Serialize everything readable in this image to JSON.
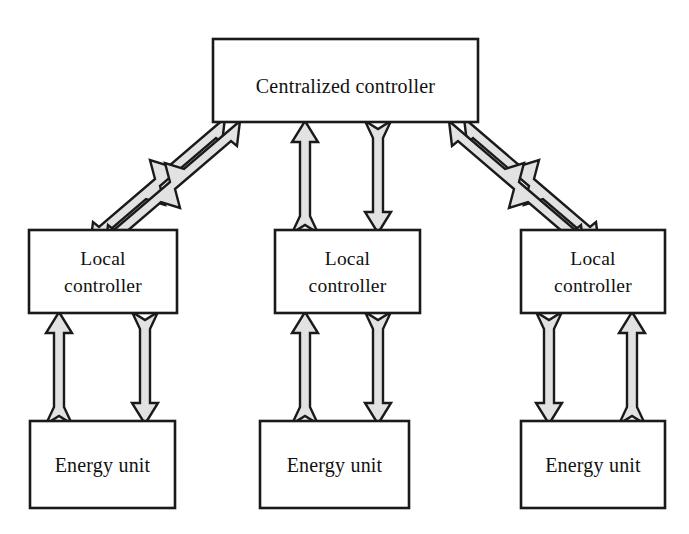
{
  "diagram": {
    "colors": {
      "box_fill": "#ffffff",
      "box_stroke": "#1a1a1a",
      "arrow_fill": "#e2e2e2",
      "arrow_stroke": "#1a1a1a",
      "background": "#ffffff",
      "text": "#111111"
    },
    "nodes": {
      "centralized_controller": {
        "label": "Centralized controller",
        "x": 213,
        "y": 39,
        "w": 265,
        "h": 83
      },
      "local_controllers": [
        {
          "label_line1": "Local",
          "label_line2": "controller",
          "x": 29,
          "y": 230,
          "w": 148,
          "h": 83
        },
        {
          "label_line1": "Local",
          "label_line2": "controller",
          "x": 275,
          "y": 230,
          "w": 145,
          "h": 83
        },
        {
          "label_line1": "Local",
          "label_line2": "controller",
          "x": 521,
          "y": 230,
          "w": 144,
          "h": 83
        }
      ],
      "energy_units": [
        {
          "label": "Energy unit",
          "x": 30,
          "y": 421,
          "w": 145,
          "h": 87
        },
        {
          "label": "Energy unit",
          "x": 260,
          "y": 421,
          "w": 149,
          "h": 87
        },
        {
          "label": "Energy unit",
          "x": 521,
          "y": 421,
          "w": 144,
          "h": 87
        }
      ]
    },
    "connections": [
      {
        "name": "left-local-to-centralized",
        "direction": "up-right",
        "style": "block-arrow"
      },
      {
        "name": "centralized-to-left-local",
        "direction": "down-left",
        "style": "block-arrow"
      },
      {
        "name": "middle-local-to-centralized",
        "direction": "up",
        "style": "block-arrow"
      },
      {
        "name": "centralized-to-middle-local",
        "direction": "down",
        "style": "block-arrow"
      },
      {
        "name": "right-local-to-centralized",
        "direction": "up-left",
        "style": "block-arrow"
      },
      {
        "name": "centralized-to-right-local",
        "direction": "down-right",
        "style": "block-arrow"
      },
      {
        "name": "left-energy-to-local",
        "direction": "up",
        "style": "block-arrow"
      },
      {
        "name": "left-local-to-energy",
        "direction": "down",
        "style": "block-arrow"
      },
      {
        "name": "middle-energy-to-local",
        "direction": "up",
        "style": "block-arrow"
      },
      {
        "name": "middle-local-to-energy",
        "direction": "down",
        "style": "block-arrow"
      },
      {
        "name": "right-local-to-energy",
        "direction": "down",
        "style": "block-arrow"
      },
      {
        "name": "right-energy-to-local",
        "direction": "up",
        "style": "block-arrow"
      }
    ]
  }
}
